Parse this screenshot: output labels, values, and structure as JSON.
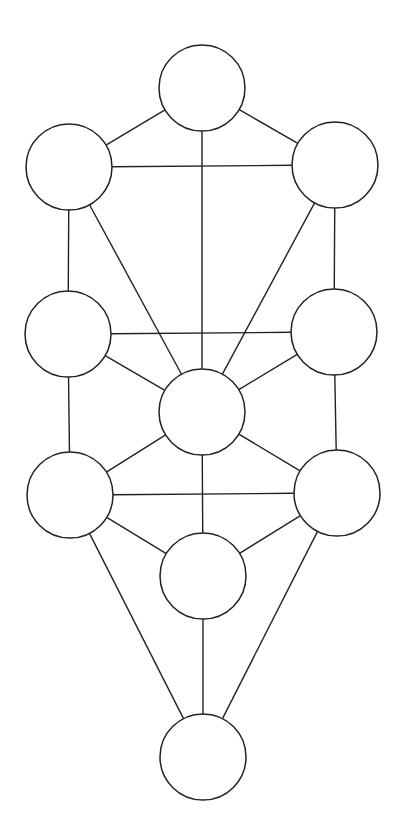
{
  "diagram": {
    "type": "graph",
    "stroke_color": "#222222",
    "background": "#ffffff",
    "node_radius": 43,
    "nodes": [
      {
        "id": "n1",
        "x": 202,
        "y": 88
      },
      {
        "id": "n2",
        "x": 335,
        "y": 165
      },
      {
        "id": "n3",
        "x": 69,
        "y": 167
      },
      {
        "id": "n4",
        "x": 334,
        "y": 332
      },
      {
        "id": "n5",
        "x": 68,
        "y": 334
      },
      {
        "id": "n6",
        "x": 202,
        "y": 412
      },
      {
        "id": "n7",
        "x": 337,
        "y": 493
      },
      {
        "id": "n8",
        "x": 70,
        "y": 495
      },
      {
        "id": "n9",
        "x": 203,
        "y": 576
      },
      {
        "id": "n10",
        "x": 203,
        "y": 757
      }
    ],
    "edges": [
      [
        "n1",
        "n2"
      ],
      [
        "n1",
        "n3"
      ],
      [
        "n1",
        "n6"
      ],
      [
        "n2",
        "n3"
      ],
      [
        "n2",
        "n4"
      ],
      [
        "n2",
        "n6"
      ],
      [
        "n3",
        "n5"
      ],
      [
        "n3",
        "n6"
      ],
      [
        "n4",
        "n5"
      ],
      [
        "n4",
        "n6"
      ],
      [
        "n4",
        "n7"
      ],
      [
        "n5",
        "n6"
      ],
      [
        "n5",
        "n8"
      ],
      [
        "n6",
        "n7"
      ],
      [
        "n6",
        "n8"
      ],
      [
        "n6",
        "n9"
      ],
      [
        "n7",
        "n8"
      ],
      [
        "n7",
        "n9"
      ],
      [
        "n7",
        "n10"
      ],
      [
        "n8",
        "n9"
      ],
      [
        "n8",
        "n10"
      ],
      [
        "n9",
        "n10"
      ]
    ]
  }
}
